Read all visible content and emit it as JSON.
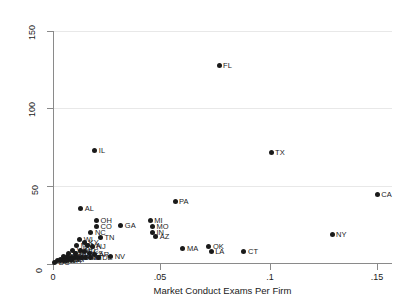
{
  "chart_data": {
    "type": "scatter",
    "title": "",
    "xlabel": "Market Conduct Exams Per Firm",
    "ylabel": "",
    "xlim": [
      0,
      0.15
    ],
    "ylim": [
      0,
      150
    ],
    "xticks": [
      "0",
      ".05",
      ".1",
      ".15"
    ],
    "xtick_values": [
      0,
      0.05,
      0.1,
      0.15
    ],
    "yticks": [
      "0",
      "50",
      "100",
      "150"
    ],
    "ytick_values": [
      0,
      50,
      100,
      150
    ],
    "grid": "horizontal",
    "legend": "none",
    "marker_color": "#1a1a1a",
    "points": [
      {
        "label": "FL",
        "x": 0.0735,
        "y": 128
      },
      {
        "label": "TX",
        "x": 0.0965,
        "y": 72
      },
      {
        "label": "IL",
        "x": 0.0185,
        "y": 73
      },
      {
        "label": "CA",
        "x": 0.1435,
        "y": 45
      },
      {
        "label": "NY",
        "x": 0.1235,
        "y": 19
      },
      {
        "label": "PA",
        "x": 0.054,
        "y": 40
      },
      {
        "label": "AL",
        "x": 0.0123,
        "y": 36
      },
      {
        "label": "OH",
        "x": 0.0193,
        "y": 28
      },
      {
        "label": "CO",
        "x": 0.0193,
        "y": 24
      },
      {
        "label": "NC",
        "x": 0.0168,
        "y": 20
      },
      {
        "label": "TN",
        "x": 0.021,
        "y": 17
      },
      {
        "label": "GA",
        "x": 0.03,
        "y": 25
      },
      {
        "label": "MI",
        "x": 0.043,
        "y": 28
      },
      {
        "label": "MO",
        "x": 0.044,
        "y": 24
      },
      {
        "label": "IN",
        "x": 0.044,
        "y": 20
      },
      {
        "label": "AZ",
        "x": 0.0455,
        "y": 18
      },
      {
        "label": "MA",
        "x": 0.0575,
        "y": 10
      },
      {
        "label": "OK",
        "x": 0.069,
        "y": 11
      },
      {
        "label": "LA",
        "x": 0.07,
        "y": 8
      },
      {
        "label": "CT",
        "x": 0.0845,
        "y": 8
      },
      {
        "label": "WI",
        "x": 0.0118,
        "y": 16
      },
      {
        "label": "KY",
        "x": 0.014,
        "y": 14
      },
      {
        "label": "MN",
        "x": 0.0105,
        "y": 12
      },
      {
        "label": "VA",
        "x": 0.0152,
        "y": 12
      },
      {
        "label": "NJ",
        "x": 0.0175,
        "y": 11
      },
      {
        "label": "WA",
        "x": 0.0088,
        "y": 9
      },
      {
        "label": "MD",
        "x": 0.012,
        "y": 9
      },
      {
        "label": "SC",
        "x": 0.0138,
        "y": 8
      },
      {
        "label": "IA",
        "x": 0.01,
        "y": 7
      },
      {
        "label": "OR",
        "x": 0.007,
        "y": 7
      },
      {
        "label": "KS",
        "x": 0.016,
        "y": 7
      },
      {
        "label": "AR",
        "x": 0.0185,
        "y": 6
      },
      {
        "label": "NV",
        "x": 0.0255,
        "y": 5
      },
      {
        "label": "WV",
        "x": 0.0046,
        "y": 5
      },
      {
        "label": "MS",
        "x": 0.0062,
        "y": 5
      },
      {
        "label": "NE",
        "x": 0.008,
        "y": 4
      },
      {
        "label": "UT",
        "x": 0.0095,
        "y": 4
      },
      {
        "label": "ID",
        "x": 0.011,
        "y": 4
      },
      {
        "label": "NM",
        "x": 0.0128,
        "y": 4
      },
      {
        "label": "ME",
        "x": 0.0145,
        "y": 4
      },
      {
        "label": "HI",
        "x": 0.0165,
        "y": 4
      },
      {
        "label": "DE",
        "x": 0.02,
        "y": 4
      },
      {
        "label": "MT",
        "x": 0.0035,
        "y": 3
      },
      {
        "label": "SD",
        "x": 0.0052,
        "y": 3
      },
      {
        "label": "ND",
        "x": 0.0068,
        "y": 3
      },
      {
        "label": "VT",
        "x": 0.0084,
        "y": 3
      },
      {
        "label": "WY",
        "x": 0.002,
        "y": 2
      },
      {
        "label": "AK",
        "x": 0.0032,
        "y": 2
      },
      {
        "label": "RI",
        "x": 0.0046,
        "y": 2
      },
      {
        "label": "NH",
        "x": 0.006,
        "y": 2
      },
      {
        "label": "DC",
        "x": 0.0008,
        "y": 1
      }
    ],
    "visible_point_labels": [
      "FL",
      "TX",
      "IL",
      "CA",
      "NY",
      "PA",
      "AL",
      "OH",
      "CO",
      "NC",
      "TN",
      "GA",
      "MI",
      "MO",
      "IN",
      "AZ",
      "MA",
      "OK",
      "LA",
      "CT",
      "WI",
      "KY",
      "MN",
      "VA",
      "NJ",
      "WA",
      "MD",
      "SC",
      "IA",
      "OR",
      "KS",
      "AR",
      "NV",
      "WV",
      "MS",
      "NE",
      "UT",
      "ID",
      "NM",
      "ME",
      "HI",
      "DE",
      "MT",
      "SD",
      "ND",
      "VT",
      "WY",
      "AK",
      "RI",
      "NH",
      "DC"
    ]
  }
}
